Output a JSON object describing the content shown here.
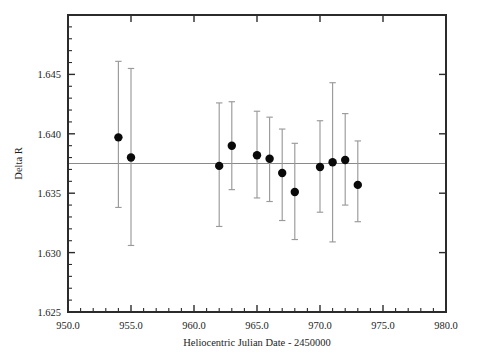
{
  "chart_data": {
    "type": "scatter",
    "title": "",
    "subtitle": "",
    "xlabel": "Heliocentric Julian Date - 2450000",
    "ylabel": "Delta R",
    "xlim": [
      950.0,
      980.0
    ],
    "ylim": [
      1.625,
      1.65
    ],
    "x_ticks_labeled": [
      "950.0",
      "955.0",
      "960.0",
      "965.0",
      "970.0",
      "975.0",
      "980.0"
    ],
    "x_tick_values": [
      950.0,
      955.0,
      960.0,
      965.0,
      970.0,
      975.0,
      980.0
    ],
    "x_minor_tick_step": 1.0,
    "y_ticks_labeled": [
      "1.625",
      "1.630",
      "1.635",
      "1.640",
      "1.645"
    ],
    "y_tick_values": [
      1.625,
      1.63,
      1.635,
      1.64,
      1.645
    ],
    "y_minor_tick_step": 0.001,
    "grid": false,
    "legend": false,
    "legend_position": "none",
    "reference_line": {
      "orientation": "horizontal",
      "y": 1.6375,
      "label": "",
      "color": "#8a8a8a"
    },
    "marker_style": "filled-circle",
    "marker_color": "#0a0a0a",
    "errorbar_color": "#9a9a9a",
    "series": [
      {
        "name": "Delta R",
        "x": [
          954.0,
          955.0,
          962.0,
          963.0,
          965.0,
          966.0,
          967.0,
          968.0,
          970.0,
          971.0,
          972.0,
          973.0
        ],
        "y": [
          1.6397,
          1.638,
          1.6373,
          1.639,
          1.6382,
          1.6379,
          1.6367,
          1.6351,
          1.6372,
          1.6376,
          1.6378,
          1.6357
        ],
        "yerr_upper": [
          1.6461,
          1.6455,
          1.6426,
          1.6427,
          1.6419,
          1.6414,
          1.6404,
          1.6392,
          1.6411,
          1.6443,
          1.6417,
          1.6394
        ],
        "yerr_lower": [
          1.6338,
          1.6306,
          1.6322,
          1.6353,
          1.6346,
          1.6343,
          1.6327,
          1.6311,
          1.6334,
          1.6309,
          1.634,
          1.6326
        ]
      }
    ]
  },
  "axes": {
    "x_label": "Heliocentric Julian Date - 2450000",
    "y_label": "Delta R"
  }
}
